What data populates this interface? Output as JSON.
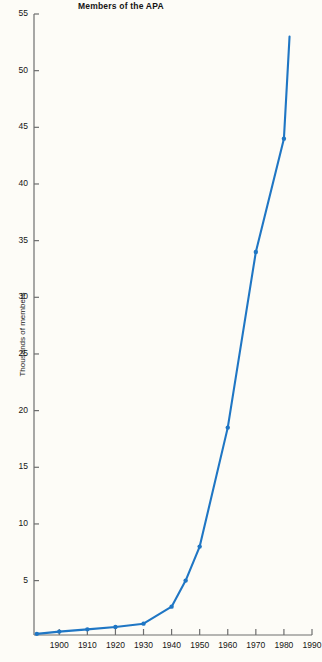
{
  "chart": {
    "title": "Members of the APA",
    "ylabel": "Thousands of members",
    "xlabel": ""
  },
  "chart_data": {
    "type": "line",
    "title": "Members of the APA",
    "xlabel": "",
    "ylabel": "Thousands of members",
    "xlim": [
      1891,
      1990
    ],
    "ylim": [
      0,
      55
    ],
    "xticks": [
      1900,
      1910,
      1920,
      1930,
      1940,
      1950,
      1960,
      1970,
      1980,
      1990
    ],
    "xtick_labels": [
      "1900",
      "1910",
      "1920",
      "1930",
      "1940",
      "1950",
      "1960",
      "1970",
      "1980",
      "1990"
    ],
    "yticks": [
      5,
      10,
      15,
      20,
      25,
      30,
      35,
      40,
      45,
      50,
      55
    ],
    "ytick_labels": [
      "5",
      "10",
      "15",
      "20",
      "25",
      "30",
      "35",
      "40",
      "45",
      "50",
      "55"
    ],
    "grid": false,
    "legend": false,
    "line_color": "#1f76c4",
    "marker": "circle",
    "series": [
      {
        "name": "Members of the APA",
        "x": [
          1892,
          1900,
          1910,
          1920,
          1930,
          1940,
          1945,
          1950,
          1960,
          1970,
          1980,
          1982
        ],
        "values": [
          0.3,
          0.5,
          0.7,
          0.9,
          1.2,
          2.7,
          5.0,
          8.0,
          18.5,
          34.0,
          44.0,
          53.0
        ]
      }
    ]
  }
}
